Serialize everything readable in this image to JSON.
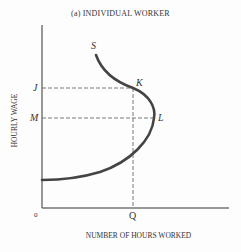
{
  "title": "(a) INDIVIDUAL WORKER",
  "axes": {
    "x_label": "NUMBER OF HOURS WORKED",
    "y_label": "HOURLY WAGE",
    "origin_label": "0"
  },
  "labels": {
    "curve": "S",
    "point_k": "K",
    "point_l": "L",
    "wage_j": "J",
    "wage_m": "M",
    "hours_q": "Q"
  },
  "colors": {
    "curve": "#444444",
    "axis": "#333333",
    "dashed": "#555555"
  }
}
